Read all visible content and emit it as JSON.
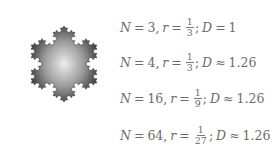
{
  "figure": {
    "image": {
      "description": "Koch snowflake fractal, gray shaded with lighter center",
      "fill_dark": "#3c3c3c",
      "fill_light": "#e6e6e6"
    },
    "rows": [
      {
        "N_label": "N",
        "N_value": "3",
        "r_label": "r",
        "r_num": "1",
        "r_den": "3",
        "D_label": "D",
        "D_rel": "=",
        "D_value": "1"
      },
      {
        "N_label": "N",
        "N_value": "4",
        "r_label": "r",
        "r_num": "1",
        "r_den": "3",
        "D_label": "D",
        "D_rel": "≈",
        "D_value": "1.26"
      },
      {
        "N_label": "N",
        "N_value": "16",
        "r_label": "r",
        "r_num": "1",
        "r_den": "9",
        "D_label": "D",
        "D_rel": "≈",
        "D_value": "1.26"
      },
      {
        "N_label": "N",
        "N_value": "64",
        "r_label": "r",
        "r_num": "1",
        "r_den": "27",
        "D_label": "D",
        "D_rel": "≈",
        "D_value": "1.26"
      }
    ],
    "symbols": {
      "eq": "=",
      "comma": ",",
      "semicolon": ";"
    }
  }
}
